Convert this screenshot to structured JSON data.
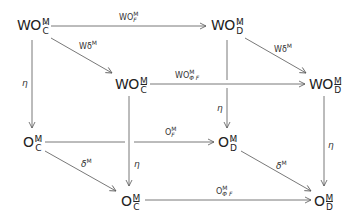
{
  "diagram": {
    "type": "commutative-cube",
    "nodes": {
      "wo_c_tilde": {
        "base": "WO",
        "sup": "M",
        "sub": "C",
        "accent": "tilde"
      },
      "wo_d_tilde": {
        "base": "WO",
        "sup": "M",
        "sub": "D",
        "accent": "tilde"
      },
      "wo_c_bar": {
        "base": "WO",
        "sup": "M",
        "sub": "C",
        "accent": "bar"
      },
      "wo_d_bar": {
        "base": "WO",
        "sup": "M",
        "sub": "D",
        "accent": "bar"
      },
      "o_c_tilde": {
        "base": "O",
        "sup": "M",
        "sub": "C",
        "accent": "tilde"
      },
      "o_d_tilde": {
        "base": "O",
        "sup": "M",
        "sub": "D",
        "accent": "tilde"
      },
      "o_c_bar": {
        "base": "O",
        "sup": "M",
        "sub": "C",
        "accent": "bar"
      },
      "o_d_bar": {
        "base": "O",
        "sup": "M",
        "sub": "D",
        "accent": "bar"
      }
    },
    "edges": {
      "wo_f": {
        "base": "WO",
        "sup": "M",
        "sub": "F",
        "from": "wo_c_tilde",
        "to": "wo_d_tilde"
      },
      "wdelta_l": {
        "text": "Wδ",
        "sup": "M",
        "from": "wo_c_tilde",
        "to": "wo_c_bar"
      },
      "wdelta_r": {
        "text": "Wδ",
        "sup": "M",
        "from": "wo_d_tilde",
        "to": "wo_d_bar"
      },
      "wo_phi_f": {
        "base": "WO",
        "sup": "M",
        "sub": "Φ F",
        "from": "wo_c_bar",
        "to": "wo_d_bar"
      },
      "eta_back_l": {
        "text": "η",
        "from": "wo_c_tilde",
        "to": "o_c_tilde"
      },
      "eta_back_r": {
        "text": "η",
        "from": "wo_d_tilde",
        "to": "o_d_tilde"
      },
      "eta_front_l": {
        "text": "η",
        "from": "wo_c_bar",
        "to": "o_c_bar"
      },
      "eta_front_r": {
        "text": "η",
        "from": "wo_d_bar",
        "to": "o_d_bar"
      },
      "o_f": {
        "base": "O",
        "sup": "M",
        "sub": "F",
        "from": "o_c_tilde",
        "to": "o_d_tilde"
      },
      "delta_l": {
        "text": "δ",
        "sup": "M",
        "from": "o_c_tilde",
        "to": "o_c_bar"
      },
      "delta_r": {
        "text": "δ",
        "sup": "M",
        "from": "o_d_tilde",
        "to": "o_d_bar"
      },
      "o_phi_f": {
        "base": "O",
        "sup": "M",
        "sub": "Φ F",
        "from": "o_c_bar",
        "to": "o_d_bar"
      }
    },
    "colors": {
      "line": "#555555",
      "text": "#222222",
      "background": "#ffffff"
    }
  }
}
